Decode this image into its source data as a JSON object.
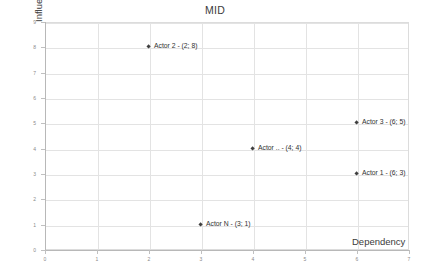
{
  "chart_data": {
    "type": "scatter",
    "title": "MID",
    "xlabel": "Dependency",
    "ylabel": "Influence",
    "xlim": [
      0,
      7
    ],
    "ylim": [
      0,
      9
    ],
    "xticks": [
      "0",
      "1",
      "2",
      "3",
      "4",
      "5",
      "6",
      "7"
    ],
    "yticks": [
      "0",
      "1",
      "2",
      "3",
      "4",
      "5",
      "6",
      "7",
      "8",
      "9"
    ],
    "grid": true,
    "legend": "none",
    "points": [
      {
        "label": "Actor 2 - (2; 8)",
        "name": "Actor 2",
        "x": 2,
        "y": 8
      },
      {
        "label": "Actor 3 - (6; 5)",
        "name": "Actor 3",
        "x": 6,
        "y": 5
      },
      {
        "label": "Actor .. - (4; 4)",
        "name": "Actor ..",
        "x": 4,
        "y": 4
      },
      {
        "label": "Actor 1 - (6; 3)",
        "name": "Actor 1",
        "x": 6,
        "y": 3
      },
      {
        "label": "Actor N - (3; 1)",
        "name": "Actor N",
        "x": 3,
        "y": 1
      }
    ],
    "colors": {
      "marker": "#3f3f3f",
      "gridline": "#e3e3e3",
      "axis": "#b8b8b8",
      "text": "#404040"
    }
  }
}
